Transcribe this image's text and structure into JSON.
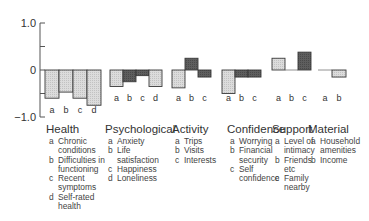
{
  "chart_data": {
    "type": "bar",
    "title": "",
    "xlabel": "",
    "ylabel": "",
    "ylim": [
      -1.0,
      1.0
    ],
    "yticks": [
      1.0,
      0.5,
      0,
      -0.5,
      -1.0
    ],
    "ytick_labels": [
      "1.0",
      "",
      "0",
      "",
      "−1.0"
    ],
    "grid": false,
    "legend": "none",
    "groups": [
      {
        "name": "Health",
        "bars": [
          {
            "label": "a",
            "value": -0.6,
            "shade": "light"
          },
          {
            "label": "b",
            "value": -0.47,
            "shade": "light"
          },
          {
            "label": "c",
            "value": -0.6,
            "shade": "light"
          },
          {
            "label": "d",
            "value": -0.75,
            "shade": "light"
          }
        ]
      },
      {
        "name": "Psychological",
        "bars": [
          {
            "label": "a",
            "value": -0.35,
            "shade": "light"
          },
          {
            "label": "b",
            "value": -0.25,
            "shade": "dark"
          },
          {
            "label": "c",
            "value": -0.12,
            "shade": "dark"
          },
          {
            "label": "d",
            "value": -0.35,
            "shade": "light"
          }
        ]
      },
      {
        "name": "Activity",
        "bars": [
          {
            "label": "a",
            "value": -0.38,
            "shade": "light"
          },
          {
            "label": "b",
            "value": 0.25,
            "shade": "dark"
          },
          {
            "label": "c",
            "value": -0.15,
            "shade": "dark"
          }
        ]
      },
      {
        "name": "Confidence",
        "bars": [
          {
            "label": "a",
            "value": -0.5,
            "shade": "light"
          },
          {
            "label": "b",
            "value": -0.15,
            "shade": "dark"
          },
          {
            "label": "c",
            "value": -0.15,
            "shade": "dark"
          }
        ]
      },
      {
        "name": "Support",
        "bars": [
          {
            "label": "a",
            "value": 0.25,
            "shade": "light"
          },
          {
            "label": "b",
            "value": 0.0,
            "shade": "light"
          },
          {
            "label": "c",
            "value": 0.38,
            "shade": "dark"
          }
        ]
      },
      {
        "name": "Material",
        "bars": [
          {
            "label": "a",
            "value": 0.0,
            "shade": "light"
          },
          {
            "label": "b",
            "value": -0.15,
            "shade": "light"
          }
        ]
      }
    ],
    "colors": {
      "light": "#d4d4d4",
      "dark": "#5a5a5a",
      "outline": "#3a3a3a"
    }
  },
  "legend_groups": [
    {
      "title": "Health",
      "items": [
        {
          "k": "a",
          "v": "Chronic\nconditions"
        },
        {
          "k": "b",
          "v": "Difficulties in\nfunctioning"
        },
        {
          "k": "c",
          "v": "Recent\nsymptoms"
        },
        {
          "k": "d",
          "v": "Self-rated\nhealth"
        }
      ]
    },
    {
      "title": "Psychological",
      "items": [
        {
          "k": "a",
          "v": "Anxiety"
        },
        {
          "k": "b",
          "v": "Life\nsatisfaction"
        },
        {
          "k": "c",
          "v": "Happiness"
        },
        {
          "k": "d",
          "v": "Loneliness"
        }
      ]
    },
    {
      "title": "Activity",
      "items": [
        {
          "k": "a",
          "v": "Trips"
        },
        {
          "k": "b",
          "v": "Visits"
        },
        {
          "k": "c",
          "v": "Interests"
        }
      ]
    },
    {
      "title": "Confidence",
      "items": [
        {
          "k": "a",
          "v": "Worrying"
        },
        {
          "k": "b",
          "v": "Financial\nsecurity"
        },
        {
          "k": "c",
          "v": "Self\nconfidence"
        }
      ]
    },
    {
      "title": "Support",
      "items": [
        {
          "k": "a",
          "v": "Level of\nintimacy"
        },
        {
          "k": "b",
          "v": "Friends\netc"
        },
        {
          "k": "c",
          "v": "Family\nnearby"
        }
      ]
    },
    {
      "title": "Material",
      "items": [
        {
          "k": "a",
          "v": "Household\namenities"
        },
        {
          "k": "b",
          "v": "Income"
        }
      ]
    }
  ]
}
